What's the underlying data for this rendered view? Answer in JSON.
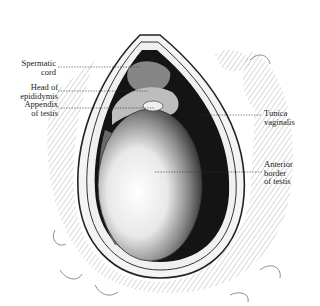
{
  "figure": {
    "labels_left": [
      {
        "id": "spermatic-cord",
        "text": "Spermatic\ncord"
      },
      {
        "id": "head-of-epididymis",
        "text": "Head of\nepididymis"
      },
      {
        "id": "appendix-of-testis",
        "text": "Appendix\nof testis"
      }
    ],
    "labels_right": [
      {
        "id": "tunica-vaginalis",
        "text": "Tunica\nvaginalis"
      },
      {
        "id": "anterior-border-of-testis",
        "text": "Anterior\nborder\nof testis"
      }
    ],
    "colors": {
      "background": "#ffffff",
      "ink": "#1a1a1a",
      "cavity": "#141414",
      "testis_light": "#f2f2f2",
      "testis_shade": "#3a3a3a"
    }
  }
}
